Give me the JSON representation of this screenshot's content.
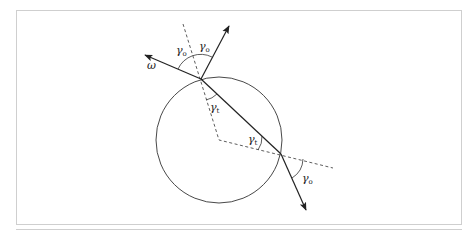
{
  "figure": {
    "colors": {
      "stroke": "#222222",
      "frame": "#cccccc",
      "background": "#ffffff"
    },
    "labels": {
      "omega": "ω",
      "gamma_o_left": {
        "base": "γ",
        "sub": "o"
      },
      "gamma_o_right": {
        "base": "γ",
        "sub": "o"
      },
      "gamma_t_top": {
        "base": "γ",
        "sub": "t"
      },
      "gamma_t_bottom": {
        "base": "γ",
        "sub": "t"
      },
      "gamma_o_exit": {
        "base": "γ",
        "sub": "o"
      }
    },
    "elements": [
      "circle",
      "incident-ray-omega",
      "reflected-ray",
      "refracted-chord",
      "exit-ray",
      "normal-dashed-top",
      "normal-dashed-bottom"
    ]
  }
}
